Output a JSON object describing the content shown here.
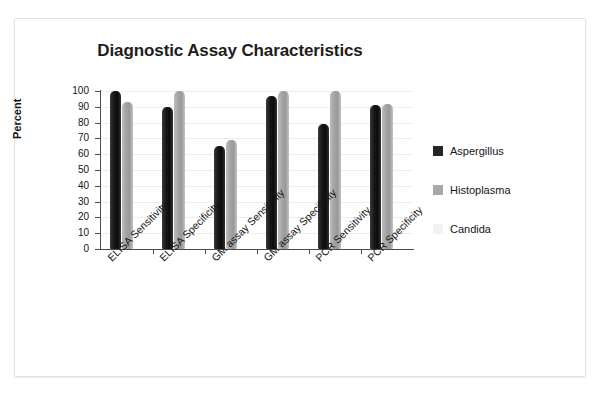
{
  "top_caption": "",
  "chart_data": {
    "type": "bar",
    "title": "Diagnostic Assay Characteristics",
    "xlabel": "",
    "ylabel": "Percent",
    "ylim": [
      0,
      100
    ],
    "ytick_step": 10,
    "yticks": [
      100,
      90,
      80,
      70,
      60,
      50,
      40,
      30,
      20,
      10,
      0
    ],
    "grid": true,
    "legend_position": "right",
    "categories": [
      "ELISA Sensitivity",
      "ELISA Specificity",
      "GM assay Sensitivity",
      "GM assay Specificity",
      "PCR Sensitivity",
      "PCR Specificity"
    ],
    "series": [
      {
        "name": "Aspergillus",
        "color": "#262626",
        "values": [
          100,
          90,
          65,
          97,
          79,
          91
        ]
      },
      {
        "name": "Histoplasma",
        "color": "#a8a8a8",
        "values": [
          93,
          100,
          69,
          100,
          100,
          92
        ]
      },
      {
        "name": "Candida",
        "color": "#f1f1f1",
        "values": [
          0,
          0,
          0,
          0,
          0,
          0
        ]
      }
    ]
  }
}
